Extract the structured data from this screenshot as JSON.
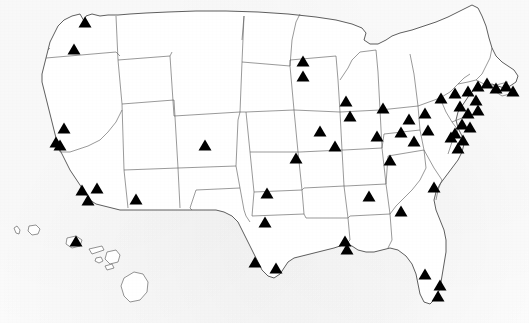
{
  "figure": {
    "kind": "map",
    "title": "",
    "region": "United States",
    "projection_note": "contiguous United States with Hawaii inset at lower left",
    "background_color": "#fcfcfc",
    "outline_color": "#2a2a2a",
    "interior_border_color": "#555555",
    "marker": {
      "name": "triangle-marker",
      "shape": "triangle",
      "fill_color": "#000000",
      "width_px": 13,
      "height_px": 11,
      "count": 56
    }
  },
  "chart_data": {
    "type": "scatter",
    "title": "",
    "xlabel": "",
    "ylabel": "",
    "projection": "pixel coordinates of a United States map, origin top-left",
    "xlim": [
      0,
      529
    ],
    "ylim": [
      323,
      0
    ],
    "grid": false,
    "legend": null,
    "marker_symbol": "triangle",
    "marker_color": "#000000",
    "series": [
      {
        "name": "locations",
        "points": [
          {
            "x": 85,
            "y": 22,
            "region": "Pacific Northwest"
          },
          {
            "x": 74,
            "y": 49,
            "region": "Pacific Northwest"
          },
          {
            "x": 64,
            "y": 128,
            "region": "California"
          },
          {
            "x": 56,
            "y": 142,
            "region": "California"
          },
          {
            "x": 60,
            "y": 145,
            "region": "California"
          },
          {
            "x": 82,
            "y": 190,
            "region": "California"
          },
          {
            "x": 97,
            "y": 188,
            "region": "California"
          },
          {
            "x": 88,
            "y": 200,
            "region": "California"
          },
          {
            "x": 136,
            "y": 199,
            "region": "Southwest"
          },
          {
            "x": 205,
            "y": 145,
            "region": "Mountain"
          },
          {
            "x": 267,
            "y": 193,
            "region": "South Central"
          },
          {
            "x": 265,
            "y": 222,
            "region": "South Central"
          },
          {
            "x": 255,
            "y": 262,
            "region": "South Central"
          },
          {
            "x": 276,
            "y": 268,
            "region": "South Central"
          },
          {
            "x": 303,
            "y": 76,
            "region": "Upper Midwest"
          },
          {
            "x": 346,
            "y": 101,
            "region": "Upper Midwest"
          },
          {
            "x": 350,
            "y": 116,
            "region": "Midwest"
          },
          {
            "x": 383,
            "y": 108,
            "region": "Midwest"
          },
          {
            "x": 377,
            "y": 136,
            "region": "Midwest"
          },
          {
            "x": 401,
            "y": 132,
            "region": "Midwest"
          },
          {
            "x": 369,
            "y": 196,
            "region": "Mid South"
          },
          {
            "x": 296,
            "y": 158,
            "region": "Midwest"
          },
          {
            "x": 409,
            "y": 119,
            "region": "Great Lakes"
          },
          {
            "x": 425,
            "y": 113,
            "region": "Great Lakes"
          },
          {
            "x": 428,
            "y": 130,
            "region": "Appalachia"
          },
          {
            "x": 434,
            "y": 187,
            "region": "Southeast"
          },
          {
            "x": 401,
            "y": 211,
            "region": "Southeast"
          },
          {
            "x": 345,
            "y": 241,
            "region": "Gulf Coast"
          },
          {
            "x": 347,
            "y": 249,
            "region": "Gulf Coast"
          },
          {
            "x": 425,
            "y": 274,
            "region": "Florida"
          },
          {
            "x": 440,
            "y": 285,
            "region": "Florida"
          },
          {
            "x": 438,
            "y": 296,
            "region": "Florida"
          },
          {
            "x": 303,
            "y": 61,
            "region": "Upper Midwest"
          },
          {
            "x": 441,
            "y": 98,
            "region": "Northeast"
          },
          {
            "x": 455,
            "y": 93,
            "region": "Northeast"
          },
          {
            "x": 460,
            "y": 106,
            "region": "Northeast"
          },
          {
            "x": 468,
            "y": 91,
            "region": "Northeast"
          },
          {
            "x": 478,
            "y": 86,
            "region": "Northeast"
          },
          {
            "x": 487,
            "y": 83,
            "region": "Northeast"
          },
          {
            "x": 496,
            "y": 88,
            "region": "Northeast"
          },
          {
            "x": 506,
            "y": 86,
            "region": "Northeast"
          },
          {
            "x": 513,
            "y": 91,
            "region": "Northeast"
          },
          {
            "x": 476,
            "y": 100,
            "region": "Northeast"
          },
          {
            "x": 468,
            "y": 113,
            "region": "Mid-Atlantic"
          },
          {
            "x": 478,
            "y": 110,
            "region": "Mid-Atlantic"
          },
          {
            "x": 462,
            "y": 124,
            "region": "Mid-Atlantic"
          },
          {
            "x": 470,
            "y": 127,
            "region": "Mid-Atlantic"
          },
          {
            "x": 455,
            "y": 133,
            "region": "Mid-Atlantic"
          },
          {
            "x": 463,
            "y": 140,
            "region": "Mid-Atlantic"
          },
          {
            "x": 458,
            "y": 148,
            "region": "Mid-Atlantic"
          },
          {
            "x": 451,
            "y": 137,
            "region": "Mid-Atlantic"
          },
          {
            "x": 76,
            "y": 241,
            "region": "Hawaii"
          },
          {
            "x": 414,
            "y": 141,
            "region": "Mid-Atlantic"
          },
          {
            "x": 390,
            "y": 160,
            "region": "Midwest"
          },
          {
            "x": 335,
            "y": 146,
            "region": "Midwest"
          },
          {
            "x": 320,
            "y": 131,
            "region": "Midwest"
          }
        ]
      }
    ]
  }
}
